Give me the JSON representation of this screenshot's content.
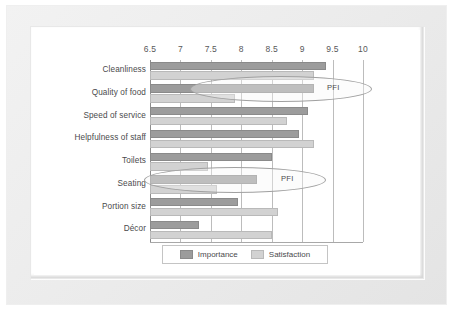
{
  "chart_data": {
    "type": "bar",
    "orientation": "horizontal",
    "title": "",
    "xlabel": "",
    "ylabel": "",
    "xlim": [
      6.5,
      10
    ],
    "xticks": [
      "6.5",
      "7",
      "7.5",
      "8",
      "8.5",
      "9",
      "9.5",
      "10"
    ],
    "grid": true,
    "legend_position": "bottom",
    "categories": [
      "Cleanliness",
      "Quality of food",
      "Speed of service",
      "Helpfulness of staff",
      "Toilets",
      "Seating",
      "Portion size",
      "Décor"
    ],
    "series": [
      {
        "name": "Importance",
        "color": "#9c9c9c",
        "values": [
          9.4,
          9.2,
          9.1,
          8.95,
          8.5,
          8.25,
          7.95,
          7.3
        ]
      },
      {
        "name": "Satisfaction",
        "color": "#d2d2d2",
        "values": [
          9.2,
          7.9,
          8.75,
          9.2,
          7.45,
          7.6,
          8.6,
          8.5
        ]
      }
    ],
    "annotations": [
      {
        "text": "PFI",
        "category": "Quality of food"
      },
      {
        "text": "PFI",
        "category": "Toilets"
      }
    ]
  },
  "legend": {
    "entries": [
      {
        "label": "Importance"
      },
      {
        "label": "Satisfaction"
      }
    ]
  }
}
